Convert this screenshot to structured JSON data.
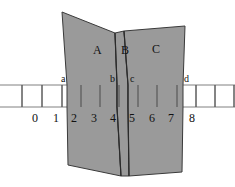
{
  "figure": {
    "title": "",
    "background_color": "#ffffff",
    "band_fill": "#9a9a9a",
    "band_stroke": "#3a3a3a",
    "axis_color": "#777777",
    "text_color": "#111111"
  },
  "panels": [
    {
      "id": "A",
      "label": "A",
      "x": 93,
      "y": 44
    },
    {
      "id": "B",
      "label": "B",
      "x": 121,
      "y": 44
    },
    {
      "id": "C",
      "label": "C",
      "x": 152,
      "y": 43
    }
  ],
  "point_labels": [
    {
      "id": "a",
      "label": "a",
      "x": 61,
      "y": 74
    },
    {
      "id": "b",
      "label": "b",
      "x": 110,
      "y": 74
    },
    {
      "id": "c",
      "label": "c",
      "x": 130,
      "y": 74
    },
    {
      "id": "d",
      "label": "d",
      "x": 184,
      "y": 74
    }
  ],
  "axis": {
    "tick_labels": [
      "0",
      "1",
      "2",
      "3",
      "4",
      "5",
      "6",
      "7",
      "8"
    ],
    "tick_label_x": [
      32,
      53,
      71,
      91,
      110,
      129,
      149,
      168,
      189
    ],
    "tick_label_y": 112,
    "grid_line_x": [
      22,
      42,
      62,
      81,
      100,
      119,
      138,
      157,
      177,
      196,
      215,
      234
    ],
    "band_top_y": 85,
    "band_bottom_y": 107,
    "rule_left": 0,
    "rule_right": 235
  },
  "band_shapes": {
    "panel_a_points": "62,12 115,33 117,84 117,107 121,176 68,165 67,107 67,85",
    "panel_b_points": "115,33 124,31 128,85 128,107 129,176 121,176 117,107 117,84",
    "panel_c_points": "124,31 185,26 183,85 183,107 182,172 129,176 128,107 128,85",
    "fold_line_1": "115,33 117,84 117,107 121,176",
    "fold_line_2": "124,31 128,85 128,107 129,176"
  },
  "chart_data": {
    "type": "diagram",
    "title": "",
    "categories": [
      "A",
      "B",
      "C"
    ],
    "boundary_points": [
      "a",
      "b",
      "c",
      "d"
    ],
    "axis_ticks": [
      0,
      1,
      2,
      3,
      4,
      5,
      6,
      7,
      8
    ],
    "panel_spans": [
      {
        "panel": "A",
        "from": "a",
        "to": "b",
        "axis_from": 1.7,
        "axis_to": 4.25
      },
      {
        "panel": "B",
        "from": "b",
        "to": "c",
        "axis_from": 4.25,
        "axis_to": 4.8
      },
      {
        "panel": "C",
        "from": "c",
        "to": "d",
        "axis_from": 4.8,
        "axis_to": 7.4
      }
    ],
    "xlabel": "",
    "ylabel": "",
    "grid": true,
    "legend": "none"
  }
}
